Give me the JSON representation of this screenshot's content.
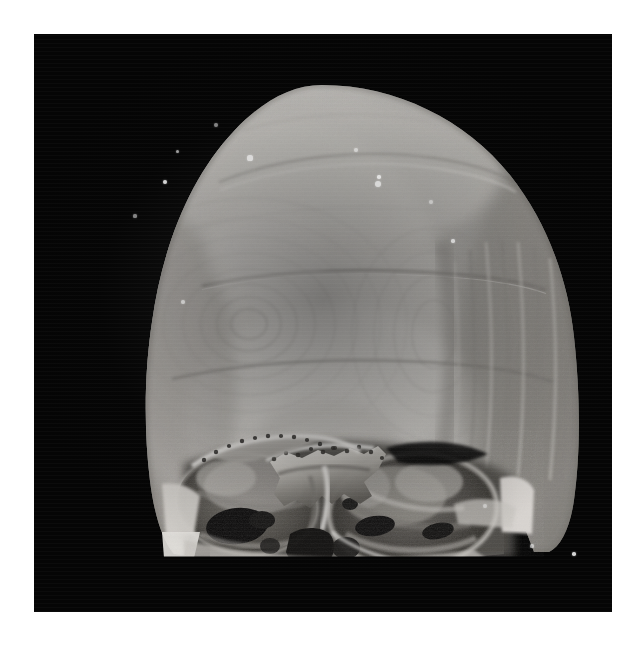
{
  "page": {
    "background_color": "#ffffff",
    "width": 644,
    "height": 646,
    "caption": ""
  },
  "viewport": {
    "name": "ct-volume-rendering-viewport",
    "background_color": "#050505",
    "left": 34,
    "top": 34,
    "width": 578,
    "height": 578,
    "border_color": "#ffffff"
  },
  "subject": {
    "modality": "CT",
    "render_type": "3D surface / volume rendering",
    "anatomy": "human skull",
    "view": "anterior-oblique (frontal) view, mandible and facial skeleton cropped",
    "description": "Volume rendered pediatric/adult calvarium seen from the front; frontal bone dominates the upper field, orbits and sphenoid region are exposed at the base where the volume is clipped.",
    "colors": {
      "bone_bright": "#e2e0dc",
      "bone_mid": "#c9c6c1",
      "bone_shadow": "#9d9a95",
      "cavity_dark": "#2a2825",
      "background": "#050505",
      "highlight": "#f4f3f1"
    }
  },
  "features": [
    {
      "name": "calvarium-frontal-bone",
      "label": "Frontal bone / calvarium",
      "note": "Large smooth dome occupying upper two-thirds of the render"
    },
    {
      "name": "coronal-suture-line",
      "label": "Upper seam line",
      "note": "Thin dark arc crossing the dome near the vertex"
    },
    {
      "name": "mid-seam-line",
      "label": "Mid horizontal seam",
      "note": "Second thin dark arc across the mid-forehead"
    },
    {
      "name": "lower-seam-line",
      "label": "Lower horizontal seam",
      "note": "Third faint arc above the supraorbital ridge"
    },
    {
      "name": "ring-artifact-cluster",
      "label": "Concentric ring artifacts",
      "note": "Circular reconstruction ripples on the mid-forehead"
    },
    {
      "name": "right-temporal-striations",
      "label": "Vertical striation artifacts",
      "note": "Parallel vertical ridges along the subject's left (image right) temporal region"
    },
    {
      "name": "left-orbit",
      "label": "Left orbital cavity",
      "note": "Dark socket at the lower-left of the skull base"
    },
    {
      "name": "right-orbit",
      "label": "Right orbital cavity",
      "note": "Large oval socket with internal bony detail at lower-right"
    },
    {
      "name": "sphenoid-ethmoid-complex",
      "label": "Sphenoid / ethmoid region",
      "note": "Bright jagged midline bone between the orbits"
    },
    {
      "name": "nasal-cavity-opening",
      "label": "Nasal cavity opening",
      "note": "Dark irregular aperture at the inferior midline"
    },
    {
      "name": "zygomatic-process-left",
      "label": "Left zygomatic process",
      "note": "Bone shelf projecting laterally at lower left"
    },
    {
      "name": "zygomatic-process-right",
      "label": "Right zygomatic process",
      "note": "Bright wedge projecting at lower right edge"
    },
    {
      "name": "inferior-clip-plane",
      "label": "Inferior clipping plane",
      "note": "Flat horizontal cut where the reconstruction volume ends"
    }
  ],
  "speckles": {
    "label": "Background noise / high-density speckle artifacts",
    "points": [
      {
        "x": 182,
        "y": 91,
        "r": 2.1
      },
      {
        "x": 143,
        "y": 117,
        "r": 1.5
      },
      {
        "x": 216,
        "y": 124,
        "r": 2.6
      },
      {
        "x": 131,
        "y": 148,
        "r": 2.4
      },
      {
        "x": 101,
        "y": 182,
        "r": 1.6
      },
      {
        "x": 322,
        "y": 116,
        "r": 2.0
      },
      {
        "x": 344,
        "y": 150,
        "r": 3.0
      },
      {
        "x": 345,
        "y": 143,
        "r": 1.8
      },
      {
        "x": 397,
        "y": 168,
        "r": 2.2
      },
      {
        "x": 149,
        "y": 268,
        "r": 2.3
      },
      {
        "x": 419,
        "y": 207,
        "r": 1.7
      },
      {
        "x": 540,
        "y": 520,
        "r": 1.8
      },
      {
        "x": 451,
        "y": 472,
        "r": 1.9
      },
      {
        "x": 498,
        "y": 512,
        "r": 1.6
      }
    ]
  }
}
